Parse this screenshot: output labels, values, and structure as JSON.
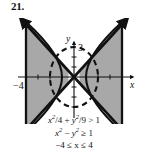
{
  "figure": {
    "number_label": "21.",
    "axes": {
      "x_axis_label": "x",
      "y_axis_label": "y",
      "x_tick_labels": [
        "-4"
      ],
      "y_tick_labels": [
        "3"
      ],
      "x_min": -4.9,
      "x_max": 4.5,
      "y_min": -3.1,
      "y_max": 3.7,
      "origin_px": {
        "x": 74,
        "y": 59
      },
      "unit_px": {
        "x": 12,
        "y": 10
      }
    },
    "curves": [
      {
        "name": "ellipse",
        "equation": "x^2/4 + y^2/9 = 1",
        "style": "dashed",
        "semi_axis_x": 2,
        "semi_axis_y": 3,
        "center": [
          0,
          0
        ]
      },
      {
        "name": "hyperbola",
        "equation": "x^2 - y^2 = 1",
        "style": "solid",
        "vertices": [
          [
            -1,
            0
          ],
          [
            1,
            0
          ]
        ]
      },
      {
        "name": "asymptote-lines",
        "equation": "y = x and y = -x",
        "style": "thick-solid-arrows"
      },
      {
        "name": "vertical-boundaries",
        "equation": "x = -4 and x = 4",
        "style": "thick-solid"
      }
    ],
    "shading": {
      "color": "#a8a8a8",
      "description": "two triangular wedge regions left and right"
    },
    "inequalities": [
      {
        "lhs": "x",
        "lhs_sup": "2",
        "text_full": "x²/4 + y²/9 > 1"
      },
      {
        "text_full": "x² − y² ≥ 1"
      },
      {
        "text_full": "−4 ≤ x ≤ 4"
      }
    ],
    "equation_lines": {
      "line1_a": "x",
      "line1_a_sup": "2",
      "line1_b": "/4 + ",
      "line1_c": "y",
      "line1_c_sup": "2",
      "line1_d": "/9 > 1",
      "line2_a": "x",
      "line2_a_sup": "2",
      "line2_b": " − ",
      "line2_c": "y",
      "line2_c_sup": "2",
      "line2_d": " ≥ 1",
      "line3": "−4 ≤ x ≤ 4"
    },
    "colors": {
      "ink": "#111111",
      "shade": "#a8a8a8",
      "background": "#ffffff"
    }
  }
}
